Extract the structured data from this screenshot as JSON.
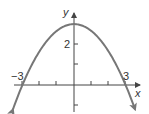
{
  "chart_data": {
    "type": "line",
    "title": "",
    "function": "y = 3 - x^2/3",
    "xlabel": "x",
    "ylabel": "y",
    "xlim": [
      -3.8,
      4
    ],
    "ylim": [
      -1.6,
      3.5
    ],
    "x_ticks": [
      -3,
      -2,
      -1,
      1,
      2,
      3
    ],
    "y_ticks": [
      -1,
      1,
      2
    ],
    "x_tick_labels": [
      {
        "value": -3,
        "label": "−3"
      },
      {
        "value": 3,
        "label": "3"
      }
    ],
    "y_tick_labels": [
      {
        "value": 2,
        "label": "2"
      }
    ],
    "series": [
      {
        "name": "parabola",
        "x": [
          -3.8,
          -3,
          -2,
          -1,
          0,
          1,
          2,
          3,
          3.8
        ],
        "values": [
          -1.81,
          0,
          1.67,
          2.67,
          3,
          2.67,
          1.67,
          0,
          -1.81
        ]
      }
    ],
    "vertex": [
      0,
      3
    ],
    "x_intercepts": [
      -3,
      3
    ],
    "arrows_on_curve_ends": true,
    "grid": false,
    "legend": null,
    "colors": {
      "curve": "#777777",
      "axes": "#444444",
      "text": "#333333"
    }
  },
  "labels": {
    "x_axis": "x",
    "y_axis": "y",
    "tick_neg3": "−3",
    "tick_3": "3",
    "tick_2": "2"
  }
}
